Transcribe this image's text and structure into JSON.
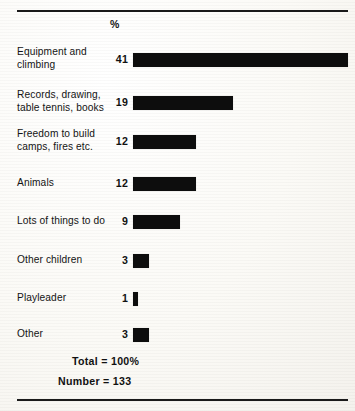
{
  "chart_data": {
    "type": "bar",
    "orientation": "horizontal",
    "title": "",
    "subtitle": "",
    "xlabel": "",
    "ylabel": "",
    "value_axis_header": "%",
    "value_unit": "%",
    "categories": [
      "Equipment and\nclimbing",
      "Records, drawing,\ntable tennis, books",
      "Freedom to build\ncamps, fires etc.",
      "Animals",
      "Lots of things to do",
      "Other children",
      "Playleader",
      "Other"
    ],
    "values": [
      41,
      19,
      12,
      12,
      9,
      3,
      1,
      3
    ],
    "value_labels": [
      "41",
      "19",
      "12",
      "12",
      "9",
      "3",
      "1",
      "3"
    ],
    "xlim": [
      0,
      41
    ],
    "grid": false,
    "legend": null,
    "bar_color": "#0d0d0d",
    "background_color": "#fbfaf7",
    "annotations": [
      "Total = 100%",
      "Number = 133"
    ]
  },
  "header": {
    "percent_symbol": "%"
  },
  "rows": [
    {
      "label": "Equipment and\nclimbing",
      "value": "41",
      "pct": 41
    },
    {
      "label": "Records, drawing,\ntable tennis, books",
      "value": "19",
      "pct": 19
    },
    {
      "label": "Freedom to build\ncamps, fires etc.",
      "value": "12",
      "pct": 12
    },
    {
      "label": "Animals",
      "value": "12",
      "pct": 12
    },
    {
      "label": "Lots of things to do",
      "value": "9",
      "pct": 9
    },
    {
      "label": "Other children",
      "value": "3",
      "pct": 3
    },
    {
      "label": "Playleader",
      "value": "1",
      "pct": 1
    },
    {
      "label": "Other",
      "value": "3",
      "pct": 3
    }
  ],
  "totals": {
    "total_label": "Total = 100%",
    "number_label": "Number = 133",
    "total_percent": "100%",
    "number_of_respondents": "133"
  }
}
